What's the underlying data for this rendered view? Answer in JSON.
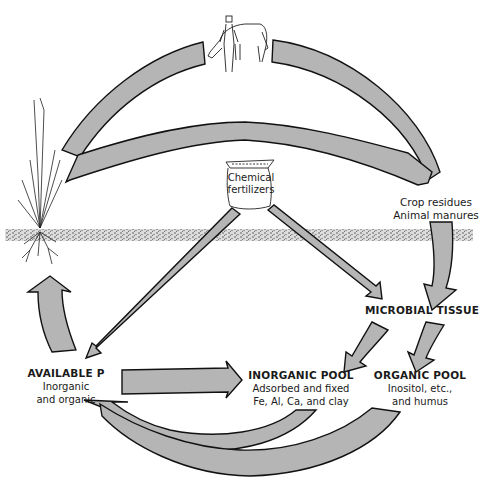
{
  "diagram": {
    "type": "phosphorus-cycle",
    "nodes": {
      "fertilizer": {
        "line1": "Chemical",
        "line2": "fertilizers"
      },
      "residues": {
        "line1": "Crop residues",
        "line2": "Animal manures"
      },
      "microbial": {
        "title": "MICROBIAL TISSUE"
      },
      "available": {
        "title": "AVAILABLE P",
        "line1": "Inorganic",
        "line2": "and organic"
      },
      "inorganic": {
        "title": "INORGANIC POOL",
        "line1": "Adsorbed and fixed",
        "line2": "Fe, Al, Ca, and clay"
      },
      "organic": {
        "title": "ORGANIC POOL",
        "line1": "Inositol, etc.,",
        "line2": "and humus"
      }
    },
    "illustrations": [
      "plant-with-roots",
      "person-with-horse",
      "fertilizer-bag",
      "soil-surface-band"
    ],
    "flows": [
      {
        "from": "plant",
        "to": "animal",
        "label": ""
      },
      {
        "from": "animal",
        "to": "residues",
        "label": ""
      },
      {
        "from": "plant",
        "to": "residues",
        "label": ""
      },
      {
        "from": "residues",
        "to": "microbial",
        "label": ""
      },
      {
        "from": "fertilizer",
        "to": "available",
        "label": ""
      },
      {
        "from": "fertilizer",
        "to": "microbial",
        "label": ""
      },
      {
        "from": "microbial",
        "to": "inorganic",
        "label": ""
      },
      {
        "from": "microbial",
        "to": "organic",
        "label": ""
      },
      {
        "from": "available",
        "to": "inorganic",
        "label": ""
      },
      {
        "from": "inorganic",
        "to": "available",
        "label": ""
      },
      {
        "from": "organic",
        "to": "available",
        "label": ""
      },
      {
        "from": "available",
        "to": "plant",
        "label": ""
      }
    ],
    "colors": {
      "arrow_fill": "#b5b5b5",
      "outline": "#111111",
      "soil": "#555555"
    }
  }
}
